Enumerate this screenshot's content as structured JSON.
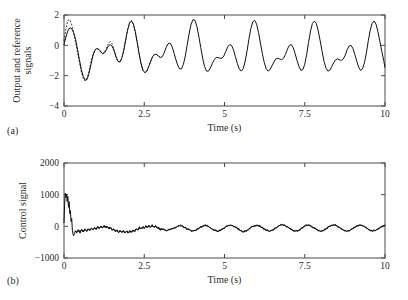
{
  "figure": {
    "background": "#ffffff",
    "line_color": "#111111",
    "axis_color": "#4a4a4a",
    "panel_labels": {
      "a": "(a)",
      "b": "(b)"
    }
  },
  "chart_data": [
    {
      "id": "panel-a",
      "type": "line",
      "title": "",
      "subtitle": "",
      "xlabel": "Time (s)",
      "ylabel": "Output and reference signals",
      "xlim": [
        0,
        10
      ],
      "ylim": [
        -4,
        2
      ],
      "xticks": [
        0,
        2.5,
        5,
        7.5,
        10
      ],
      "xticklabels": [
        "0",
        "2.5",
        "5",
        "7.5",
        "10"
      ],
      "yticks": [
        2,
        0,
        -2,
        -4
      ],
      "yticklabels": [
        "2",
        "0",
        "−2",
        "−4"
      ],
      "grid": false,
      "legend": null,
      "annotations": [
        "(a)"
      ],
      "series": [
        {
          "name": "Output signal",
          "style": "solid",
          "x": [
            0.0,
            0.06,
            0.12,
            0.18,
            0.24,
            0.3,
            0.36,
            0.42,
            0.48,
            0.54,
            0.6,
            0.66,
            0.72,
            0.78,
            0.84,
            0.9,
            0.96,
            1.02,
            1.08,
            1.14,
            1.2,
            1.26,
            1.32,
            1.38,
            1.44,
            1.5,
            1.56,
            1.62,
            1.68,
            1.74,
            1.8,
            1.86,
            1.92,
            1.98,
            2.04,
            2.1,
            2.16,
            2.22,
            2.28,
            2.34,
            2.4,
            2.46,
            2.52,
            2.58,
            2.64,
            2.7,
            2.76,
            2.82,
            2.88,
            2.94,
            3.0,
            3.06,
            3.12,
            3.18,
            3.24,
            3.3,
            3.36,
            3.42,
            3.48,
            3.54,
            3.6,
            3.66,
            3.72,
            3.78,
            3.84,
            3.9,
            3.96,
            4.02,
            4.08,
            4.14,
            4.2,
            4.26,
            4.32,
            4.38,
            4.44,
            4.5,
            4.56,
            4.62,
            4.68,
            4.74,
            4.8,
            4.86,
            4.92,
            4.98,
            5.04,
            5.1,
            5.16,
            5.22,
            5.28,
            5.34,
            5.4,
            5.46,
            5.52,
            5.58,
            5.64,
            5.7,
            5.76,
            5.82,
            5.88,
            5.94,
            6.0,
            6.06,
            6.12,
            6.18,
            6.24,
            6.3,
            6.36,
            6.42,
            6.48,
            6.54,
            6.6,
            6.66,
            6.72,
            6.78,
            6.84,
            6.9,
            6.96,
            7.02,
            7.08,
            7.14,
            7.2,
            7.26,
            7.32,
            7.38,
            7.44,
            7.5,
            7.56,
            7.62,
            7.68,
            7.74,
            7.8,
            7.86,
            7.92,
            7.98,
            8.04,
            8.1,
            8.16,
            8.22,
            8.28,
            8.34,
            8.4,
            8.46,
            8.52,
            8.58,
            8.64,
            8.7,
            8.76,
            8.82,
            8.88,
            8.94,
            9.0,
            9.06,
            9.12,
            9.18,
            9.24,
            9.3,
            9.36,
            9.42,
            9.48,
            9.54,
            9.6,
            9.66,
            9.72,
            9.78,
            9.84,
            9.9,
            9.96,
            10.0
          ],
          "y": [
            0.05,
            0.55,
            0.95,
            1.15,
            1.1,
            0.85,
            0.4,
            -0.25,
            -0.95,
            -1.6,
            -2.05,
            -2.3,
            -2.25,
            -1.85,
            -1.25,
            -0.7,
            -0.35,
            -0.2,
            -0.25,
            -0.4,
            -0.55,
            -0.5,
            -0.3,
            -0.05,
            0.05,
            -0.05,
            -0.35,
            -0.75,
            -1.05,
            -1.1,
            -0.85,
            -0.35,
            0.35,
            1.0,
            1.45,
            1.6,
            1.4,
            0.9,
            0.2,
            -0.55,
            -1.2,
            -1.65,
            -1.8,
            -1.7,
            -1.4,
            -1.05,
            -0.75,
            -0.6,
            -0.6,
            -0.7,
            -0.8,
            -0.75,
            -0.5,
            -0.15,
            0.1,
            0.15,
            -0.05,
            -0.45,
            -0.9,
            -1.3,
            -1.55,
            -1.55,
            -1.25,
            -0.7,
            0.05,
            0.8,
            1.4,
            1.7,
            1.65,
            1.25,
            0.6,
            -0.15,
            -0.85,
            -1.4,
            -1.7,
            -1.7,
            -1.5,
            -1.2,
            -0.95,
            -0.8,
            -0.8,
            -0.85,
            -0.85,
            -0.7,
            -0.4,
            -0.1,
            0.05,
            0.0,
            -0.3,
            -0.75,
            -1.2,
            -1.55,
            -1.7,
            -1.55,
            -1.1,
            -0.4,
            0.4,
            1.1,
            1.55,
            1.65,
            1.4,
            0.85,
            0.15,
            -0.55,
            -1.15,
            -1.55,
            -1.7,
            -1.6,
            -1.35,
            -1.1,
            -0.9,
            -0.85,
            -0.9,
            -0.95,
            -0.85,
            -0.6,
            -0.25,
            0.0,
            0.05,
            -0.15,
            -0.55,
            -1.0,
            -1.4,
            -1.65,
            -1.6,
            -1.25,
            -0.6,
            0.2,
            0.95,
            1.45,
            1.6,
            1.45,
            0.95,
            0.3,
            -0.4,
            -1.05,
            -1.5,
            -1.7,
            -1.65,
            -1.4,
            -1.15,
            -0.95,
            -0.9,
            -0.95,
            -1.0,
            -0.9,
            -0.65,
            -0.3,
            -0.05,
            0.0,
            -0.2,
            -0.6,
            -1.05,
            -1.45,
            -1.65,
            -1.55,
            -1.15,
            -0.5,
            0.3,
            1.0,
            1.45,
            1.6,
            1.4,
            0.9,
            0.25,
            -0.4,
            -1.0,
            -1.45,
            -1.65,
            -1.6,
            -1.35,
            -1.05,
            -0.75,
            -0.45,
            -0.15,
            0.1,
            0.25
          ]
        },
        {
          "name": "Reference signal",
          "style": "dashed",
          "x": [
            0.0,
            0.06,
            0.12,
            0.18,
            0.24,
            0.3,
            0.36,
            0.42,
            0.48,
            0.54,
            0.6,
            0.66,
            0.72,
            0.78,
            0.84,
            0.9,
            0.96,
            1.02,
            1.08,
            1.14,
            1.2,
            1.26,
            1.32,
            1.38,
            1.44,
            1.5,
            1.56,
            1.62,
            1.68,
            1.74,
            1.8,
            1.86,
            1.92,
            1.98,
            2.04,
            2.1,
            2.16,
            2.22,
            2.28,
            2.34,
            2.4,
            2.46,
            2.52,
            2.58,
            2.64,
            2.7,
            2.76,
            2.82,
            2.88,
            2.94,
            3.0
          ],
          "y": [
            0.3,
            1.1,
            1.65,
            1.7,
            1.35,
            0.8,
            0.2,
            -0.45,
            -1.1,
            -1.75,
            -2.2,
            -2.35,
            -2.15,
            -1.7,
            -1.1,
            -0.6,
            -0.3,
            -0.2,
            -0.3,
            -0.45,
            -0.55,
            -0.45,
            -0.2,
            0.1,
            0.25,
            0.1,
            -0.3,
            -0.75,
            -1.05,
            -1.1,
            -0.85,
            -0.35,
            0.35,
            1.0,
            1.5,
            1.65,
            1.45,
            0.9,
            0.2,
            -0.55,
            -1.2,
            -1.65,
            -1.8,
            -1.7,
            -1.4,
            -1.05,
            -0.75,
            -0.6,
            -0.6,
            -0.7,
            -0.8
          ]
        }
      ]
    },
    {
      "id": "panel-b",
      "type": "line",
      "title": "",
      "subtitle": "",
      "xlabel": "Time (s)",
      "ylabel": "Control signal",
      "xlim": [
        0,
        10
      ],
      "ylim": [
        -1000,
        2000
      ],
      "xticks": [
        0,
        2.5,
        5,
        7.5,
        10
      ],
      "xticklabels": [
        "0",
        "2.5",
        "5",
        "7.5",
        "10"
      ],
      "yticks": [
        2000,
        1000,
        0,
        -1000
      ],
      "yticklabels": [
        "2000",
        "1000",
        "0",
        "−1000"
      ],
      "grid": false,
      "legend": null,
      "annotations": [
        "(b)"
      ],
      "series": [
        {
          "name": "Control signal",
          "style": "solid",
          "x": [
            0.0,
            0.02,
            0.04,
            0.06,
            0.08,
            0.1,
            0.12,
            0.14,
            0.16,
            0.18,
            0.2,
            0.22,
            0.24,
            0.26,
            0.28,
            0.3,
            0.35,
            0.4,
            0.45,
            0.5,
            0.55,
            0.6,
            0.65,
            0.7,
            0.75,
            0.8,
            0.85,
            0.9,
            0.95,
            1.0,
            1.05,
            1.1,
            1.15,
            1.2,
            1.25,
            1.3,
            1.35,
            1.4,
            1.45,
            1.5,
            1.55,
            1.6,
            1.65,
            1.7,
            1.75,
            1.8,
            1.85,
            1.9,
            1.95,
            2.0,
            2.05,
            2.1,
            2.15,
            2.2,
            2.25,
            2.3,
            2.35,
            2.4,
            2.45,
            2.5,
            2.55,
            2.6,
            2.65,
            2.7,
            2.75,
            2.8,
            2.85,
            2.9,
            2.95,
            3.0,
            3.1,
            3.2,
            3.3,
            3.4,
            3.5,
            3.6,
            3.7,
            3.8,
            3.9,
            4.0,
            4.1,
            4.2,
            4.3,
            4.4,
            4.5,
            4.6,
            4.7,
            4.8,
            4.9,
            5.0,
            5.1,
            5.2,
            5.3,
            5.4,
            5.5,
            5.6,
            5.7,
            5.8,
            5.9,
            6.0,
            6.1,
            6.2,
            6.3,
            6.4,
            6.5,
            6.6,
            6.7,
            6.8,
            6.9,
            7.0,
            7.1,
            7.2,
            7.3,
            7.4,
            7.5,
            7.6,
            7.7,
            7.8,
            7.9,
            8.0,
            8.1,
            8.2,
            8.3,
            8.4,
            8.5,
            8.6,
            8.7,
            8.8,
            8.9,
            9.0,
            9.1,
            9.2,
            9.3,
            9.4,
            9.5,
            9.6,
            9.7,
            9.8,
            9.9,
            10.0
          ],
          "y": [
            120,
            700,
            1050,
            900,
            1020,
            780,
            950,
            600,
            780,
            400,
            500,
            150,
            250,
            -120,
            -250,
            -300,
            -150,
            -200,
            -120,
            -190,
            -110,
            -170,
            -90,
            -150,
            -80,
            -130,
            -60,
            -110,
            -40,
            -80,
            -20,
            -60,
            0,
            -40,
            10,
            -30,
            -10,
            -60,
            -50,
            -110,
            -100,
            -160,
            -130,
            -180,
            -140,
            -190,
            -150,
            -200,
            -160,
            -200,
            -150,
            -190,
            -120,
            -150,
            -80,
            -110,
            -40,
            -70,
            -20,
            -50,
            0,
            -30,
            20,
            -20,
            30,
            -30,
            0,
            -60,
            -40,
            -100,
            -80,
            -140,
            -100,
            -60,
            -20,
            20,
            0,
            -60,
            -110,
            -150,
            -120,
            -60,
            0,
            30,
            -10,
            -80,
            -130,
            -160,
            -110,
            -40,
            20,
            40,
            0,
            -70,
            -130,
            -170,
            -130,
            -50,
            10,
            40,
            10,
            -60,
            -120,
            -160,
            -120,
            -50,
            20,
            50,
            20,
            -50,
            -110,
            -150,
            -130,
            -60,
            10,
            40,
            10,
            -60,
            -120,
            -160,
            -120,
            -50,
            20,
            50,
            20,
            -50,
            -110,
            -150,
            -130,
            -70,
            0,
            40,
            20,
            -40,
            -100,
            -150,
            -130,
            -70,
            0,
            40
          ]
        }
      ]
    }
  ]
}
